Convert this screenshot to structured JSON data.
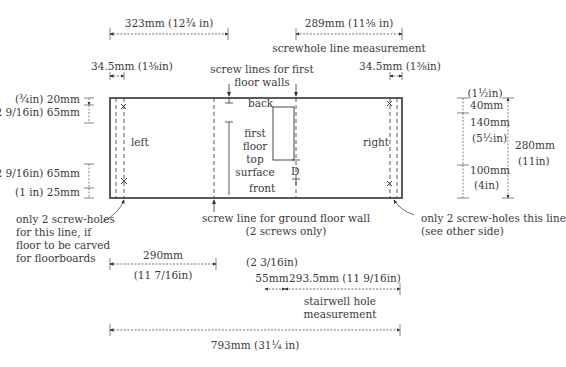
{
  "diagram": {
    "panel": {
      "left": 110,
      "top": 98,
      "right": 402,
      "bottom": 198
    },
    "dimensions": {
      "top_left_width": "323mm  (12¾ in)",
      "top_right_width": "289mm  (11⅜ in)",
      "screwhole_caption": "screwhole line measurement",
      "left_edge_inset": "34.5mm  (1⅜in)",
      "right_edge_inset": "34.5mm  (1⅜in)",
      "left_20": "(¾in)  20mm",
      "left_65a": "(2 9/16in)  65mm",
      "left_65b": "(2 9/16in)  65mm",
      "left_25": "(1 in)  25mm",
      "right_40_in": "(1½in)",
      "right_40_mm": "40mm",
      "right_140_mm": "140mm",
      "right_140_in": "(5½in)",
      "right_100_mm": "100mm",
      "right_100_in": "(4in)",
      "right_280_mm": "280mm",
      "right_280_in": "(11in)",
      "bottom_290_mm": "290mm",
      "bottom_290_in": "(11 7/16in)",
      "stair_55_in": "(2 3/16in)",
      "stair_55_mm": "55mm",
      "stair_293": "293.5mm  (11 9/16in)",
      "stair_caption": "stairwell hole\nmeasurement",
      "total_width": "793mm  (31¼ in)"
    },
    "labels": {
      "screw_lines_first_floor": "screw lines for first\nfloor walls",
      "back": "back",
      "front": "front",
      "left": "left",
      "right": "right",
      "first_floor_top_surface": "first\nfloor\ntop\nsurface",
      "D": "D",
      "screw_line_ground": "screw line for ground floor wall\n(2 screws only)",
      "left_note": "only 2 screw-holes\nfor this line, if\nfloor to be carved\nfor floorboards",
      "right_note": "only 2 screw-holes this line\n(see other side)"
    }
  }
}
